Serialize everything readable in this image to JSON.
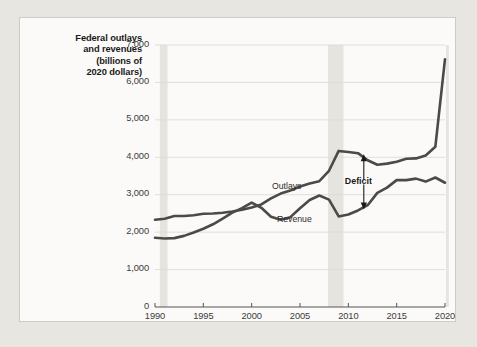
{
  "figure": {
    "background_color": "#fbfaf8",
    "page_color": "#e8e6e1",
    "border_color": "#cfccc6"
  },
  "chart_data": {
    "type": "line",
    "title": "Federal outlays and revenues (billions of 2020 dollars)",
    "title_lines": [
      "Federal outlays",
      "and revenues",
      "(billions of",
      "2020 dollars)"
    ],
    "xlabel": "",
    "ylabel": "Federal outlays and revenues (billions of 2020 dollars)",
    "xlim": [
      1990,
      2020
    ],
    "ylim": [
      0,
      7000
    ],
    "xticks": [
      1990,
      1995,
      2000,
      2005,
      2010,
      2015,
      2020
    ],
    "xtick_labels": [
      "1990",
      "1995",
      "2000",
      "2005",
      "2010",
      "2015",
      "2020"
    ],
    "yticks": [
      0,
      1000,
      2000,
      3000,
      4000,
      5000,
      6000,
      7000
    ],
    "ytick_labels": [
      "0",
      "1,000",
      "2,000",
      "3,000",
      "4,000",
      "5,000",
      "6,000",
      "7,000"
    ],
    "grid": "horizontal",
    "legend_position": "inline-labels",
    "line_color": "#4a4a4a",
    "gridline_color": "#dedbd5",
    "recession_band_color": "#e6e4df",
    "x": [
      1990,
      1991,
      1992,
      1993,
      1994,
      1995,
      1996,
      1997,
      1998,
      1999,
      2000,
      2001,
      2002,
      2003,
      2004,
      2005,
      2006,
      2007,
      2008,
      2009,
      2010,
      2011,
      2012,
      2013,
      2014,
      2015,
      2016,
      2017,
      2018,
      2019,
      2020
    ],
    "series": [
      {
        "name": "Outlays",
        "label": "Outlays",
        "values": [
          2330,
          2360,
          2430,
          2430,
          2450,
          2490,
          2500,
          2520,
          2550,
          2600,
          2660,
          2740,
          2900,
          3030,
          3110,
          3220,
          3300,
          3360,
          3640,
          4170,
          4140,
          4110,
          3920,
          3800,
          3830,
          3880,
          3960,
          3970,
          4050,
          4280,
          6620
        ]
      },
      {
        "name": "Revenue",
        "label": "Revenue",
        "values": [
          1850,
          1830,
          1840,
          1900,
          1990,
          2090,
          2210,
          2360,
          2520,
          2640,
          2790,
          2650,
          2410,
          2330,
          2400,
          2640,
          2860,
          2980,
          2870,
          2420,
          2470,
          2580,
          2720,
          3050,
          3190,
          3390,
          3390,
          3430,
          3350,
          3460,
          3320
        ]
      }
    ],
    "recession_bands": [
      {
        "start": 1990.5,
        "end": 1991.3
      },
      {
        "start": 2007.9,
        "end": 2009.5
      },
      {
        "start": 2020.1,
        "end": 2020.4
      }
    ],
    "annotations": [
      {
        "name": "deficit",
        "text": "Deficit",
        "x": 2011.6,
        "y_top": 4110,
        "y_bottom": 2580,
        "arrow": "double-headed-vertical"
      }
    ]
  }
}
